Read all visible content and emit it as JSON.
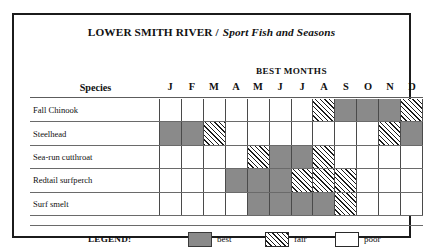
{
  "title": {
    "main": "LOWER SMITH RIVER /",
    "italic": "Sport Fish and Seasons"
  },
  "header": {
    "best_months": "BEST  MONTHS",
    "species_label": "Species"
  },
  "months": [
    "J",
    "F",
    "M",
    "A",
    "M",
    "J",
    "J",
    "A",
    "S",
    "O",
    "N",
    "D"
  ],
  "legend": {
    "label": "LEGEND:",
    "items": [
      {
        "key": "best",
        "text": "best"
      },
      {
        "key": "fair",
        "text": "fair"
      },
      {
        "key": "poor",
        "text": "poor"
      }
    ]
  },
  "colors": {
    "best": "#8a8a8a",
    "fair": "#ffffff",
    "poor": "#ffffff",
    "ink": "#1b1b1b",
    "grid": "#4a4a4a"
  },
  "chart_data": {
    "type": "heatmap",
    "title": "LOWER SMITH RIVER / Sport Fish and Seasons",
    "xlabel": "BEST  MONTHS",
    "ylabel": "Species",
    "categories": [
      "J",
      "F",
      "M",
      "A",
      "M",
      "J",
      "J",
      "A",
      "S",
      "O",
      "N",
      "D"
    ],
    "month_names": [
      "January",
      "February",
      "March",
      "April",
      "May",
      "June",
      "July",
      "August",
      "September",
      "October",
      "November",
      "December"
    ],
    "levels": [
      "poor",
      "fair",
      "best"
    ],
    "legend_position": "bottom",
    "grid": true,
    "rows": [
      {
        "species": "Fall Chinook",
        "values": [
          "poor",
          "poor",
          "poor",
          "poor",
          "poor",
          "poor",
          "poor",
          "fair",
          "best",
          "best",
          "best",
          "fair"
        ]
      },
      {
        "species": "Steelhead",
        "values": [
          "best",
          "best",
          "fair",
          "poor",
          "poor",
          "poor",
          "poor",
          "poor",
          "poor",
          "poor",
          "fair",
          "best"
        ]
      },
      {
        "species": "Sea-run cutthroat",
        "values": [
          "poor",
          "poor",
          "poor",
          "poor",
          "fair",
          "best",
          "best",
          "fair",
          "poor",
          "poor",
          "poor",
          "poor"
        ]
      },
      {
        "species": "Redtail surfperch",
        "values": [
          "poor",
          "poor",
          "poor",
          "best",
          "best",
          "best",
          "fair",
          "fair",
          "fair",
          "poor",
          "poor",
          "poor"
        ]
      },
      {
        "species": "Surf smelt",
        "values": [
          "poor",
          "poor",
          "poor",
          "poor",
          "best",
          "best",
          "best",
          "best",
          "fair",
          "poor",
          "poor",
          "poor"
        ]
      }
    ]
  }
}
